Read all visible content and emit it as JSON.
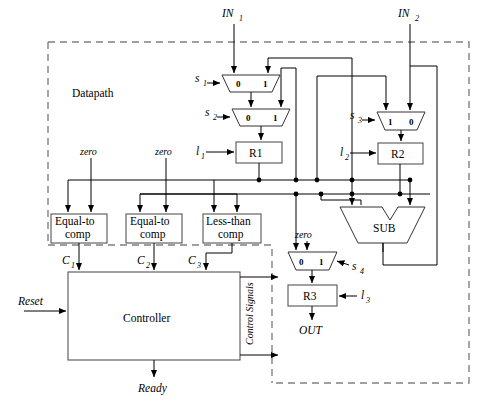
{
  "diagram": {
    "title_regions": {
      "datapath_label": "Datapath",
      "controller_label": "Controller"
    },
    "external_signals": {
      "in1": "IN",
      "in1_sub": "1",
      "in2": "IN",
      "in2_sub": "2",
      "out": "OUT",
      "reset": "Reset",
      "ready": "Ready",
      "control_signals": "Control Signals"
    },
    "constants": [
      {
        "name": "zero-constant-left",
        "label": "zero"
      },
      {
        "name": "zero-constant-mid",
        "label": "zero"
      },
      {
        "name": "zero-constant-sub",
        "label": "zero"
      }
    ],
    "registers": [
      {
        "name": "R1",
        "label": "R1",
        "load": "l",
        "load_sub": "1"
      },
      {
        "name": "R2",
        "label": "R2",
        "load": "l",
        "load_sub": "2"
      },
      {
        "name": "R3",
        "label": "R3",
        "load": "l",
        "load_sub": "3"
      }
    ],
    "muxes": [
      {
        "name": "mux-s1",
        "select": "s",
        "select_sub": "1",
        "left_port": "0",
        "right_port": "1"
      },
      {
        "name": "mux-s2",
        "select": "s",
        "select_sub": "2",
        "left_port": "0",
        "right_port": "1"
      },
      {
        "name": "mux-s3",
        "select": "s",
        "select_sub": "3",
        "left_port": "1",
        "right_port": "0"
      },
      {
        "name": "mux-s4",
        "select": "s",
        "select_sub": "4",
        "left_port": "0",
        "right_port": "1"
      }
    ],
    "comparators": [
      {
        "name": "equal-to-comp-1",
        "line1": "Equal-to",
        "line2": "comp",
        "out": "C",
        "out_sub": "1"
      },
      {
        "name": "equal-to-comp-2",
        "line1": "Equal-to",
        "line2": "comp",
        "out": "C",
        "out_sub": "2"
      },
      {
        "name": "less-than-comp",
        "line1": "Less-than",
        "line2": "comp",
        "out": "C",
        "out_sub": "3"
      }
    ],
    "alu": {
      "name": "subtractor",
      "label": "SUB"
    }
  }
}
